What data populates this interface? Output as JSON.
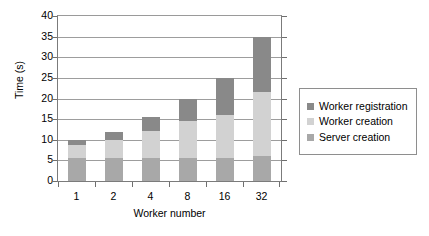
{
  "chart_data": {
    "type": "bar",
    "stacked": true,
    "title": "",
    "xlabel": "Worker number",
    "ylabel": "Time (s)",
    "categories": [
      "1",
      "2",
      "4",
      "8",
      "16",
      "32"
    ],
    "ylim": [
      0,
      40
    ],
    "ytick_labels": [
      "0",
      "5",
      "10",
      "15",
      "20",
      "25",
      "30",
      "35",
      "40"
    ],
    "ytick_values": [
      0,
      5,
      10,
      15,
      20,
      25,
      30,
      35,
      40
    ],
    "grid": "horizontal",
    "legend_position": "right",
    "series": [
      {
        "name": "Worker registration",
        "color": "#898989",
        "values": [
          1.2,
          1.8,
          3.4,
          5.5,
          9.0,
          13.5
        ]
      },
      {
        "name": "Worker creation",
        "color": "#d2d2d2",
        "values": [
          3.2,
          4.3,
          6.5,
          8.8,
          10.3,
          15.5
        ]
      },
      {
        "name": "Server creation",
        "color": "#a8a8a8",
        "values": [
          5.6,
          5.7,
          5.7,
          5.7,
          5.7,
          6.0
        ]
      }
    ],
    "totals": [
      10.0,
      11.8,
      15.6,
      20.0,
      25.0,
      35.0
    ]
  }
}
